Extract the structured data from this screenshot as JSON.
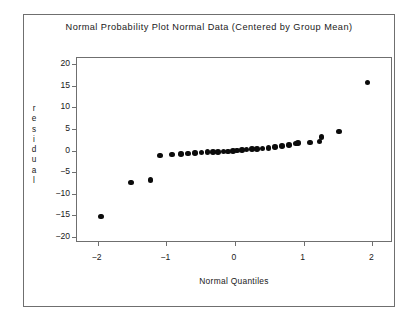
{
  "chart_data": {
    "type": "scatter",
    "title": "Normal Probability Plot Normal Data (Centered by Group Mean)",
    "xlabel": "Normal Quantiles",
    "ylabel": "residual",
    "xlim": [
      -2.3,
      2.3
    ],
    "ylim": [
      -21.5,
      21.5
    ],
    "xticks": [
      -2,
      -1,
      0,
      1,
      2
    ],
    "xticklabels": [
      "−2",
      "−1",
      "0",
      "1",
      "2"
    ],
    "yticks": [
      20,
      15,
      10,
      5,
      0,
      -5,
      -10,
      -15,
      -20
    ],
    "yticklabels": [
      "20",
      "15",
      "10",
      "5",
      "0",
      "−5",
      "−10",
      "−15",
      "−20"
    ],
    "grid": false,
    "legend": null,
    "marker": "filled-circle",
    "marker_color": "#0b0b0b",
    "n_points": 32,
    "x": [
      -1.95,
      -1.51,
      -1.23,
      -1.09,
      -0.92,
      -0.79,
      -0.68,
      -0.58,
      -0.49,
      -0.4,
      -0.32,
      -0.25,
      -0.17,
      -0.1,
      -0.03,
      0.03,
      0.1,
      0.17,
      0.25,
      0.32,
      0.4,
      0.49,
      0.58,
      0.68,
      0.79,
      0.89,
      0.92,
      1.09,
      1.23,
      1.26,
      1.51,
      1.93
    ],
    "y": [
      -15.3,
      -7.4,
      -6.9,
      -1.2,
      -0.9,
      -0.8,
      -0.7,
      -0.6,
      -0.5,
      -0.4,
      -0.35,
      -0.3,
      -0.25,
      -0.2,
      -0.1,
      0.0,
      0.1,
      0.2,
      0.3,
      0.4,
      0.5,
      0.6,
      0.8,
      1.0,
      1.3,
      1.6,
      1.7,
      1.9,
      2.1,
      3.2,
      4.4,
      15.8
    ]
  }
}
